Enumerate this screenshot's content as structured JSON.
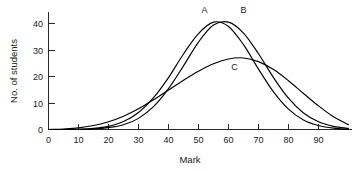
{
  "chart_data": {
    "type": "line",
    "title": "",
    "xlabel": "Mark",
    "ylabel": "No. of students",
    "xlim": [
      0,
      100
    ],
    "ylim": [
      0,
      45
    ],
    "grid": false,
    "legend": "inline-curve-labels",
    "x_ticks": [
      "0",
      "10",
      "20",
      "30",
      "40",
      "50",
      "60",
      "70",
      "80",
      "90"
    ],
    "x_tick_values": [
      0,
      10,
      20,
      30,
      40,
      50,
      60,
      70,
      80,
      90
    ],
    "y_ticks": [
      "0",
      "10",
      "20",
      "30",
      "40"
    ],
    "y_tick_values": [
      0,
      10,
      20,
      30,
      40
    ],
    "x": [
      0,
      5,
      10,
      15,
      20,
      25,
      30,
      35,
      40,
      45,
      50,
      55,
      60,
      65,
      70,
      75,
      80,
      85,
      90,
      95,
      100
    ],
    "series": [
      {
        "name": "A",
        "label": "A",
        "peak_x": 55,
        "peak_y": 40.5,
        "label_x": 52,
        "label_y": 44,
        "values": [
          0,
          0,
          0.1,
          0.4,
          1.2,
          3.0,
          6.4,
          12.0,
          19.6,
          28.5,
          36.2,
          40.5,
          38.9,
          32.0,
          22.8,
          14.2,
          7.7,
          3.6,
          1.5,
          0.5,
          0.1
        ]
      },
      {
        "name": "B",
        "label": "B",
        "peak_x": 60,
        "peak_y": 40.5,
        "label_x": 65,
        "label_y": 44,
        "values": [
          0,
          0,
          0,
          0.2,
          0.7,
          1.8,
          4.2,
          8.6,
          15.4,
          24.0,
          33.0,
          39.4,
          40.5,
          36.4,
          28.6,
          19.6,
          11.8,
          6.2,
          2.9,
          1.2,
          0.4
        ]
      },
      {
        "name": "C",
        "label": "C",
        "peak_x": 60,
        "peak_y": 27.0,
        "label_x": 62,
        "label_y": 22.5,
        "values": [
          0,
          0.2,
          0.6,
          1.5,
          2.9,
          5.0,
          7.8,
          11.2,
          14.9,
          18.6,
          22.0,
          24.8,
          26.6,
          27.0,
          25.6,
          22.6,
          18.4,
          13.6,
          8.9,
          4.8,
          1.8
        ]
      }
    ]
  },
  "axes": {
    "y_axis_title": "No. of students",
    "x_axis_title": "Mark"
  }
}
